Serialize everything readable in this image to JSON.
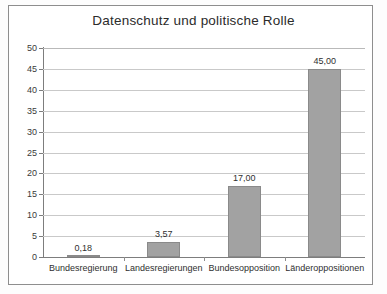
{
  "chart_data": {
    "type": "bar",
    "title": "Datenschutz und politische Rolle",
    "xlabel": "",
    "ylabel": "",
    "categories": [
      "Bundesregierung",
      "Landesregierungen",
      "Bundesopposition",
      "Länderoppositionen"
    ],
    "values": [
      0.18,
      3.57,
      17.0,
      45.0
    ],
    "data_labels": [
      "0,18",
      "3,57",
      "17,00",
      "45,00"
    ],
    "ylim": [
      0,
      50
    ],
    "ytick_step": 5,
    "ytick_labels": [
      "0",
      "5",
      "10",
      "15",
      "20",
      "25",
      "30",
      "35",
      "40",
      "45",
      "50"
    ],
    "grid": "horizontal",
    "legend": "none",
    "bar_color": "#a2a2a2",
    "bar_border_color": "#8a8a8a",
    "grid_color": "#c9c9c9",
    "axis_color": "#7d7d7d",
    "text_color": "#2f2f2f",
    "frame_color": "#8e8e8e",
    "background": "#ffffff"
  }
}
